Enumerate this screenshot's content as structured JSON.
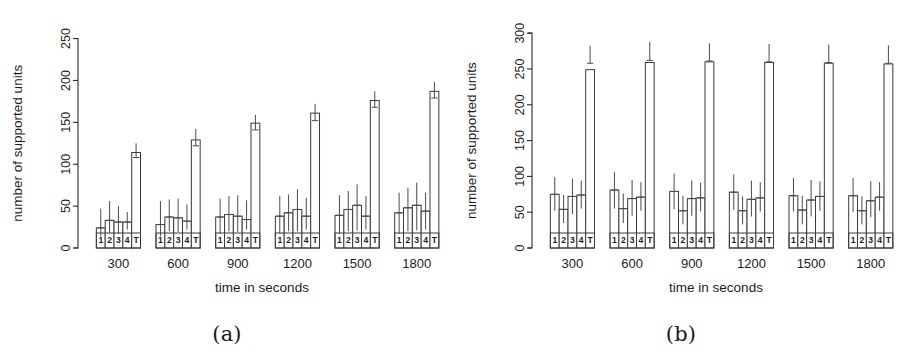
{
  "figure": {
    "panels": [
      {
        "id": "panel-a",
        "caption": "(a)",
        "ylabel": "number of supported units",
        "xlabel": "time in seconds"
      },
      {
        "id": "panel-b",
        "caption": "(b)",
        "ylabel": "number of supported units",
        "xlabel": "time in seconds"
      }
    ]
  },
  "chart_data": [
    {
      "type": "bar",
      "id": "panel-a",
      "title": "",
      "subtitle": "",
      "caption": "(a)",
      "xlabel": "time in seconds",
      "ylabel": "number of supported units",
      "ylim": [
        0,
        265
      ],
      "yticks": [
        0,
        50,
        100,
        150,
        200,
        250
      ],
      "ytick_labels": [
        "0",
        "50",
        "100",
        "150",
        "200",
        "250"
      ],
      "grid": false,
      "legend": "none",
      "categories": [
        "300",
        "600",
        "900",
        "1200",
        "1500",
        "1800"
      ],
      "bar_labels": [
        "1",
        "2",
        "3",
        "4",
        "T"
      ],
      "groups": [
        {
          "category": "300",
          "bars": [
            {
              "label": "1",
              "value": 24,
              "err_low": 14,
              "err_high": 47
            },
            {
              "label": "2",
              "value": 33,
              "err_low": 18,
              "err_high": 56
            },
            {
              "label": "3",
              "value": 31,
              "err_low": 17,
              "err_high": 50
            },
            {
              "label": "4",
              "value": 31,
              "err_low": 22,
              "err_high": 43
            },
            {
              "label": "T",
              "value": 114,
              "err_low": 108,
              "err_high": 125
            }
          ]
        },
        {
          "category": "600",
          "bars": [
            {
              "label": "1",
              "value": 28,
              "err_low": 14,
              "err_high": 56
            },
            {
              "label": "2",
              "value": 37,
              "err_low": 20,
              "err_high": 58
            },
            {
              "label": "3",
              "value": 36,
              "err_low": 19,
              "err_high": 59
            },
            {
              "label": "4",
              "value": 32,
              "err_low": 22,
              "err_high": 52
            },
            {
              "label": "T",
              "value": 129,
              "err_low": 122,
              "err_high": 142
            }
          ]
        },
        {
          "category": "900",
          "bars": [
            {
              "label": "1",
              "value": 37,
              "err_low": 17,
              "err_high": 59
            },
            {
              "label": "2",
              "value": 40,
              "err_low": 20,
              "err_high": 62
            },
            {
              "label": "3",
              "value": 38,
              "err_low": 19,
              "err_high": 63
            },
            {
              "label": "4",
              "value": 34,
              "err_low": 22,
              "err_high": 57
            },
            {
              "label": "T",
              "value": 149,
              "err_low": 141,
              "err_high": 159
            }
          ]
        },
        {
          "category": "1200",
          "bars": [
            {
              "label": "1",
              "value": 38,
              "err_low": 17,
              "err_high": 62
            },
            {
              "label": "2",
              "value": 42,
              "err_low": 20,
              "err_high": 64
            },
            {
              "label": "3",
              "value": 46,
              "err_low": 20,
              "err_high": 70
            },
            {
              "label": "4",
              "value": 38,
              "err_low": 22,
              "err_high": 60
            },
            {
              "label": "T",
              "value": 161,
              "err_low": 152,
              "err_high": 172
            }
          ]
        },
        {
          "category": "1500",
          "bars": [
            {
              "label": "1",
              "value": 39,
              "err_low": 17,
              "err_high": 63
            },
            {
              "label": "2",
              "value": 46,
              "err_low": 20,
              "err_high": 68
            },
            {
              "label": "3",
              "value": 51,
              "err_low": 21,
              "err_high": 76
            },
            {
              "label": "4",
              "value": 38,
              "err_low": 22,
              "err_high": 62
            },
            {
              "label": "T",
              "value": 176,
              "err_low": 168,
              "err_high": 187
            }
          ]
        },
        {
          "category": "1800",
          "bars": [
            {
              "label": "1",
              "value": 42,
              "err_low": 17,
              "err_high": 66
            },
            {
              "label": "2",
              "value": 48,
              "err_low": 20,
              "err_high": 72
            },
            {
              "label": "3",
              "value": 51,
              "err_low": 21,
              "err_high": 78
            },
            {
              "label": "4",
              "value": 44,
              "err_low": 22,
              "err_high": 66
            },
            {
              "label": "T",
              "value": 187,
              "err_low": 179,
              "err_high": 198
            }
          ]
        }
      ]
    },
    {
      "type": "bar",
      "id": "panel-b",
      "title": "",
      "subtitle": "",
      "caption": "(b)",
      "xlabel": "time in seconds",
      "ylabel": "number of supported units",
      "ylim": [
        0,
        310
      ],
      "yticks": [
        0,
        50,
        100,
        150,
        200,
        250,
        300
      ],
      "ytick_labels": [
        "0",
        "50",
        "100",
        "150",
        "200",
        "250",
        "300"
      ],
      "grid": false,
      "legend": "none",
      "categories": [
        "300",
        "600",
        "900",
        "1200",
        "1500",
        "1800"
      ],
      "bar_labels": [
        "1",
        "2",
        "3",
        "4",
        "T"
      ],
      "groups": [
        {
          "category": "300",
          "bars": [
            {
              "label": "1",
              "value": 75,
              "err_low": 52,
              "err_high": 99
            },
            {
              "label": "2",
              "value": 54,
              "err_low": 35,
              "err_high": 74
            },
            {
              "label": "3",
              "value": 72,
              "err_low": 47,
              "err_high": 97
            },
            {
              "label": "4",
              "value": 74,
              "err_low": 55,
              "err_high": 94
            },
            {
              "label": "T",
              "value": 249,
              "err_low": 258,
              "err_high": 282
            }
          ]
        },
        {
          "category": "600",
          "bars": [
            {
              "label": "1",
              "value": 81,
              "err_low": 55,
              "err_high": 106
            },
            {
              "label": "2",
              "value": 55,
              "err_low": 35,
              "err_high": 76
            },
            {
              "label": "3",
              "value": 69,
              "err_low": 45,
              "err_high": 95
            },
            {
              "label": "4",
              "value": 71,
              "err_low": 52,
              "err_high": 92
            },
            {
              "label": "T",
              "value": 259,
              "err_low": 262,
              "err_high": 288
            }
          ]
        },
        {
          "category": "900",
          "bars": [
            {
              "label": "1",
              "value": 79,
              "err_low": 54,
              "err_high": 104
            },
            {
              "label": "2",
              "value": 52,
              "err_low": 33,
              "err_high": 73
            },
            {
              "label": "3",
              "value": 69,
              "err_low": 45,
              "err_high": 94
            },
            {
              "label": "4",
              "value": 70,
              "err_low": 51,
              "err_high": 91
            },
            {
              "label": "T",
              "value": 260,
              "err_low": 261,
              "err_high": 286
            }
          ]
        },
        {
          "category": "1200",
          "bars": [
            {
              "label": "1",
              "value": 78,
              "err_low": 53,
              "err_high": 103
            },
            {
              "label": "2",
              "value": 52,
              "err_low": 33,
              "err_high": 72
            },
            {
              "label": "3",
              "value": 68,
              "err_low": 44,
              "err_high": 94
            },
            {
              "label": "4",
              "value": 70,
              "err_low": 51,
              "err_high": 92
            },
            {
              "label": "T",
              "value": 259,
              "err_low": 260,
              "err_high": 285
            }
          ]
        },
        {
          "category": "1500",
          "bars": [
            {
              "label": "1",
              "value": 73,
              "err_low": 51,
              "err_high": 98
            },
            {
              "label": "2",
              "value": 53,
              "err_low": 33,
              "err_high": 73
            },
            {
              "label": "3",
              "value": 67,
              "err_low": 44,
              "err_high": 95
            },
            {
              "label": "4",
              "value": 72,
              "err_low": 52,
              "err_high": 93
            },
            {
              "label": "T",
              "value": 258,
              "err_low": 259,
              "err_high": 284
            }
          ]
        },
        {
          "category": "1800",
          "bars": [
            {
              "label": "1",
              "value": 73,
              "err_low": 50,
              "err_high": 98
            },
            {
              "label": "2",
              "value": 52,
              "err_low": 33,
              "err_high": 72
            },
            {
              "label": "3",
              "value": 66,
              "err_low": 43,
              "err_high": 93
            },
            {
              "label": "4",
              "value": 71,
              "err_low": 52,
              "err_high": 92
            },
            {
              "label": "T",
              "value": 257,
              "err_low": 258,
              "err_high": 283
            }
          ]
        }
      ]
    }
  ]
}
